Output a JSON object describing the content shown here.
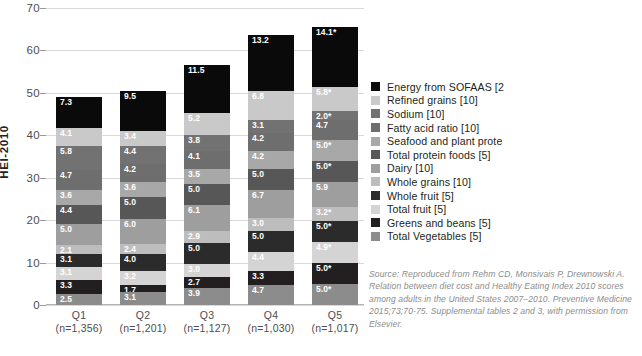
{
  "chart_data": {
    "type": "bar",
    "subtype": "stacked-column",
    "title": "",
    "xlabel": "",
    "ylabel": "HEI-2010",
    "ylim": [
      0,
      70
    ],
    "ytick_step": 10,
    "yticks": [
      "0",
      "10",
      "20",
      "30",
      "40",
      "50",
      "60",
      "70"
    ],
    "grid": true,
    "legend_position": "right",
    "categories": [
      "Q1",
      "Q2",
      "Q3",
      "Q4",
      "Q5"
    ],
    "category_sublabels": [
      "(n=1,356)",
      "(n=1,201)",
      "(n=1,127)",
      "(n=1,030)",
      "(n=1,017)"
    ],
    "series": [
      {
        "name": "Total Vegetables [5]",
        "color": "#8c8c8c",
        "values": [
          2.5,
          3.1,
          3.9,
          4.7,
          5.0
        ],
        "labels": [
          "2.5",
          "3.1",
          "3.9",
          "4.7",
          "5.0*"
        ]
      },
      {
        "name": "Greens and beans [5]",
        "color": "#231f20",
        "values": [
          3.3,
          1.7,
          2.7,
          3.3,
          5.0
        ],
        "labels": [
          "3.3",
          "1.7",
          "2.7",
          "3.3",
          "5.0*"
        ]
      },
      {
        "name": "Total fruit [5]",
        "color": "#d4d4d4",
        "values": [
          3.1,
          3.2,
          3.0,
          4.4,
          4.9
        ],
        "labels": [
          "3.1",
          "3.2",
          "3.0",
          "4.4",
          "4.9*"
        ]
      },
      {
        "name": "Whole fruit [5]",
        "color": "#2b2b2b",
        "values": [
          3.1,
          4.0,
          5.0,
          5.0,
          5.0
        ],
        "labels": [
          "3.1",
          "4.0",
          "5.0",
          "5.0",
          "5.0*"
        ]
      },
      {
        "name": "Whole grains [10]",
        "color": "#bdbdbd",
        "values": [
          2.1,
          2.4,
          2.9,
          3.0,
          3.2
        ],
        "labels": [
          "2.1",
          "2.4",
          "2.9",
          "3.0",
          "3.2*"
        ]
      },
      {
        "name": "Dairy [10]",
        "color": "#9e9e9e",
        "values": [
          5.0,
          6.0,
          6.1,
          6.7,
          5.9
        ],
        "labels": [
          "5.0",
          "6.0",
          "6.1",
          "6.7",
          "5.9"
        ]
      },
      {
        "name": "Total protein foods [5]",
        "color": "#575757",
        "values": [
          4.4,
          5.0,
          5.0,
          5.0,
          5.0
        ],
        "labels": [
          "4.4",
          "5.0",
          "5.0",
          "5.0",
          "5.0*"
        ]
      },
      {
        "name": "Seafood and plant prote",
        "color": "#a8a8a8",
        "values": [
          3.6,
          3.6,
          3.5,
          4.2,
          5.0
        ],
        "labels": [
          "3.6",
          "3.6",
          "3.5",
          "4.2",
          "5.0*"
        ]
      },
      {
        "name": "Fatty acid ratio [10]",
        "color": "#6e6e6e",
        "values": [
          4.7,
          4.2,
          4.1,
          4.2,
          4.7
        ],
        "labels": [
          "4.7",
          "4.2",
          "4.1",
          "4.2",
          "4.7"
        ]
      },
      {
        "name": "Sodium [10]",
        "color": "#727272",
        "values": [
          5.8,
          4.4,
          3.8,
          3.1,
          2.0
        ],
        "labels": [
          "5.8",
          "4.4",
          "3.8",
          "3.1",
          "2.0*"
        ]
      },
      {
        "name": "Refined grains [10]",
        "color": "#c9c9c9",
        "values": [
          4.1,
          3.4,
          5.2,
          6.8,
          5.8
        ],
        "labels": [
          "4.1",
          "3.4",
          "5.2",
          "6.8",
          "5.8*"
        ]
      },
      {
        "name": "Energy from SOFAAS [2",
        "color": "#0a0a0a",
        "values": [
          7.3,
          9.5,
          11.5,
          13.2,
          14.1
        ],
        "labels": [
          "7.3",
          "9.5",
          "11.5",
          "13.2",
          "14.1*"
        ]
      }
    ]
  },
  "source_note": "Source: Reproduced from Rehm CD, Monsivais P, Drewnowski A. Relation between diet cost and Healthy Eating Index 2010 scores among adults in the United States 2007–2010. Preventive Medicine 2015;73;70-75. Supplemental tables 2 and 3, with permission from Elsevier."
}
